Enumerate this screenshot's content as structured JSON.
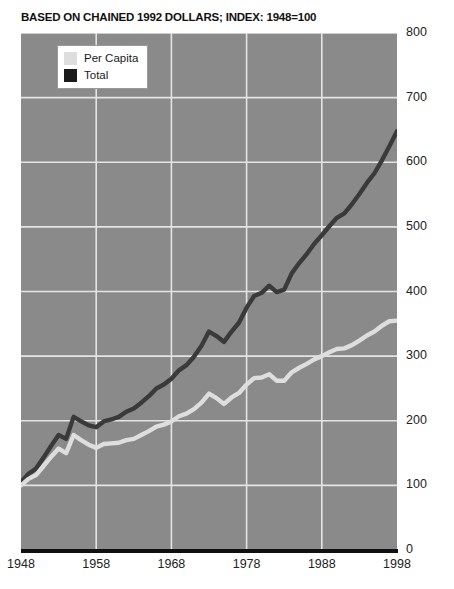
{
  "chart_data": {
    "type": "line",
    "title": "BASED ON CHAINED 1992 DOLLARS; INDEX: 1948=100",
    "xlabel": "",
    "ylabel": "",
    "xlim": [
      1948,
      1998
    ],
    "ylim": [
      0,
      800
    ],
    "grid": true,
    "legend_position": "top-left",
    "xticks": [
      "1948",
      "1958",
      "1968",
      "1978",
      "1988",
      "1998"
    ],
    "xtick_values": [
      1948,
      1958,
      1968,
      1978,
      1988,
      1998
    ],
    "yticks": [
      "0",
      "100",
      "200",
      "300",
      "400",
      "500",
      "600",
      "700",
      "800"
    ],
    "ytick_values": [
      0,
      100,
      200,
      300,
      400,
      500,
      600,
      700,
      800
    ],
    "x": [
      1948,
      1949,
      1950,
      1951,
      1952,
      1953,
      1954,
      1955,
      1956,
      1957,
      1958,
      1959,
      1960,
      1961,
      1962,
      1963,
      1964,
      1965,
      1966,
      1967,
      1968,
      1969,
      1970,
      1971,
      1972,
      1973,
      1974,
      1975,
      1976,
      1977,
      1978,
      1979,
      1980,
      1981,
      1982,
      1983,
      1984,
      1985,
      1986,
      1987,
      1988,
      1989,
      1990,
      1991,
      1992,
      1993,
      1994,
      1995,
      1996,
      1997,
      1998
    ],
    "series": [
      {
        "name": "Total",
        "color": "#3a3a3a",
        "values": [
          105,
          118,
          126,
          143,
          161,
          178,
          172,
          206,
          199,
          193,
          190,
          199,
          202,
          206,
          214,
          219,
          228,
          238,
          250,
          256,
          265,
          278,
          286,
          299,
          316,
          338,
          331,
          322,
          338,
          352,
          375,
          393,
          398,
          409,
          399,
          403,
          428,
          444,
          458,
          474,
          487,
          501,
          514,
          521,
          535,
          551,
          568,
          583,
          603,
          625,
          648
        ]
      },
      {
        "name": "Per Capita",
        "color": "#dedede",
        "values": [
          100,
          110,
          116,
          130,
          144,
          157,
          150,
          178,
          170,
          163,
          158,
          164,
          165,
          166,
          170,
          172,
          178,
          184,
          191,
          194,
          199,
          207,
          211,
          218,
          228,
          242,
          235,
          226,
          236,
          243,
          256,
          266,
          267,
          272,
          262,
          262,
          275,
          282,
          288,
          295,
          300,
          306,
          311,
          312,
          317,
          324,
          332,
          338,
          347,
          354,
          355
        ]
      }
    ]
  },
  "legend": {
    "items": [
      {
        "label": "Per Capita",
        "color": "#dedede"
      },
      {
        "label": "Total",
        "color": "#1a1a1a"
      }
    ]
  },
  "colors": {
    "plot_background": "#8a8a8a",
    "gridline": "#e4e4e4",
    "page_background": "#ffffff",
    "axis_baseline": "#101010",
    "tick_text": "#222222",
    "title_text": "#111111"
  }
}
